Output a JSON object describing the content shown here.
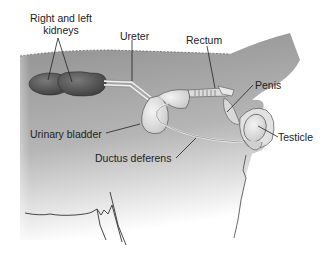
{
  "diagram": {
    "labels": {
      "kidneys": [
        "Right and left",
        "kidneys"
      ],
      "ureter": "Ureter",
      "rectum": "Rectum",
      "penis": "Penis",
      "urinary_bladder": "Urinary bladder",
      "testicle": "Testicle",
      "ductus_deferens": "Ductus deferens"
    },
    "colors": {
      "body": "#9a9a9a",
      "kidney": "#5a5a5a",
      "organ_light": "#e6e6e6",
      "outline": "#333333"
    }
  }
}
